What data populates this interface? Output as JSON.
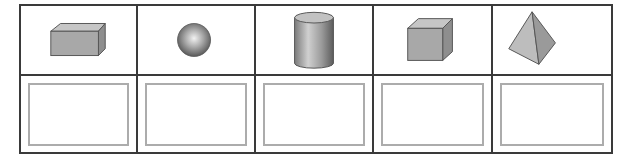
{
  "worksheet": {
    "shapes": [
      {
        "id": "cuboid",
        "icon": "cuboid-icon",
        "label": "Cuboid",
        "answer": ""
      },
      {
        "id": "sphere",
        "icon": "sphere-icon",
        "label": "Sphere",
        "answer": ""
      },
      {
        "id": "cylinder",
        "icon": "cylinder-icon",
        "label": "Cylinder",
        "answer": ""
      },
      {
        "id": "cube",
        "icon": "cube-icon",
        "label": "Cube",
        "answer": ""
      },
      {
        "id": "pyramid",
        "icon": "pyramid-icon",
        "label": "Triangular pyramid",
        "answer": ""
      }
    ],
    "colors": {
      "grid_line": "#3a3a3a",
      "answer_box_border": "#acacac",
      "shape_fill": "#a9a9a9",
      "shape_top": "#c4c4c4",
      "shape_side": "#8f8f8f",
      "shape_outline": "#555555"
    }
  }
}
